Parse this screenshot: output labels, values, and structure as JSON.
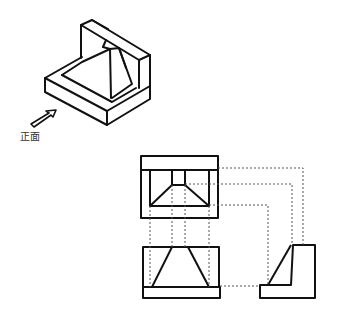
{
  "isometric": {
    "front_label": "正面",
    "arrow": "front-direction-arrow"
  },
  "views": [
    "top-view",
    "front-view",
    "right-side-view"
  ],
  "colors": {
    "line": "#111111",
    "hidden": "#555555",
    "label": "#333333"
  }
}
